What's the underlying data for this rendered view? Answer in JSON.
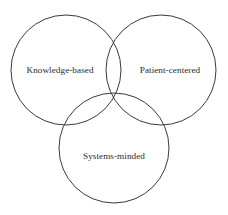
{
  "diagram": {
    "type": "venn",
    "title": "",
    "background_color": "#ffffff",
    "stroke_color": "#3a3a3a",
    "text_color": "#2b2b2b",
    "sets": [
      {
        "id": "knowledge-based",
        "label": "Knowledge-based",
        "circle": {
          "cx": 66,
          "cy": 70,
          "r": 55
        },
        "label_position": {
          "x": 60,
          "y": 71
        }
      },
      {
        "id": "patient-centered",
        "label": "Patient-centered",
        "circle": {
          "cx": 161,
          "cy": 70,
          "r": 55
        },
        "label_position": {
          "x": 170,
          "y": 71
        }
      },
      {
        "id": "systems-minded",
        "label": "Systems-minded",
        "circle": {
          "cx": 114,
          "cy": 148,
          "r": 55
        },
        "label_position": {
          "x": 114,
          "y": 157
        }
      }
    ]
  }
}
